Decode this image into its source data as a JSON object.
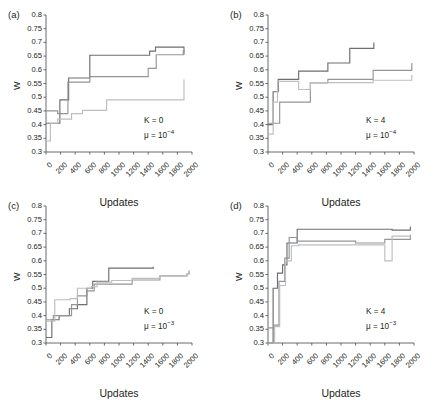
{
  "figure": {
    "xlabel": "Updates",
    "ylabel": "W",
    "panel_labels": [
      "(a)",
      "(b)",
      "(c)",
      "(d)"
    ],
    "y_ticks": [
      "0.3",
      "0.35",
      "0.4",
      "0.45",
      "0.5",
      "0.55",
      "0.6",
      "0.65",
      "0.7",
      "0.75",
      "0.8"
    ],
    "x_ticks": [
      "0",
      "200",
      "400",
      "600",
      "800",
      "1000",
      "1200",
      "1400",
      "1600",
      "1800",
      "2000"
    ],
    "colors": {
      "axis": "#58595b",
      "text": "#231f20",
      "line_dark": "#6d6e71",
      "line_mid": "#939598",
      "line_light": "#bcbec0"
    }
  },
  "chart_data": [
    {
      "type": "line",
      "title": "(a)",
      "xlabel": "Updates",
      "ylabel": "W",
      "xlim": [
        0,
        2000
      ],
      "ylim": [
        0.3,
        0.8
      ],
      "grid": false,
      "legend": "none",
      "annotations": [
        "K = 0",
        "μ = 10⁻⁴"
      ],
      "annotation_K": "K = 0",
      "annotation_mu_base": "μ = 10",
      "annotation_mu_exp": "−4",
      "step": "post",
      "series": [
        {
          "name": "run-1-dark",
          "color": "#6d6e71",
          "x": [
            0,
            40,
            150,
            190,
            280,
            310,
            580,
            600,
            1400,
            1420,
            1500,
            1880,
            1890
          ],
          "y": [
            0.405,
            0.405,
            0.405,
            0.49,
            0.49,
            0.57,
            0.57,
            0.653,
            0.653,
            0.668,
            0.683,
            0.683,
            0.655
          ]
        },
        {
          "name": "run-2-mid",
          "color": "#939598",
          "x": [
            0,
            40,
            130,
            160,
            280,
            300,
            580,
            600,
            1380,
            1400,
            1490,
            1510,
            1880,
            1900
          ],
          "y": [
            0.45,
            0.45,
            0.45,
            0.44,
            0.44,
            0.555,
            0.555,
            0.575,
            0.575,
            0.605,
            0.605,
            0.655,
            0.668,
            0.668
          ]
        },
        {
          "name": "run-3-light",
          "color": "#bcbec0",
          "x": [
            0,
            30,
            60,
            140,
            160,
            330,
            350,
            480,
            500,
            800,
            830,
            1870,
            1890
          ],
          "y": [
            0.34,
            0.34,
            0.405,
            0.405,
            0.42,
            0.42,
            0.44,
            0.44,
            0.452,
            0.452,
            0.49,
            0.49,
            0.565
          ]
        }
      ]
    },
    {
      "type": "line",
      "title": "(b)",
      "xlabel": "Updates",
      "ylabel": "W",
      "xlim": [
        0,
        2000
      ],
      "ylim": [
        0.3,
        0.8
      ],
      "grid": false,
      "legend": "none",
      "annotations": [
        "K = 4",
        "μ = 10⁻⁴"
      ],
      "annotation_K": "K = 4",
      "annotation_mu_base": "μ = 10",
      "annotation_mu_exp": "−4",
      "step": "post",
      "series": [
        {
          "name": "run-1-dark",
          "color": "#6d6e71",
          "x": [
            0,
            50,
            70,
            110,
            140,
            400,
            420,
            800,
            820,
            1100,
            1120,
            1430,
            1450
          ],
          "y": [
            0.4,
            0.4,
            0.52,
            0.52,
            0.565,
            0.565,
            0.595,
            0.595,
            0.625,
            0.625,
            0.678,
            0.678,
            0.7
          ]
        },
        {
          "name": "run-2-mid",
          "color": "#939598",
          "x": [
            0,
            60,
            90,
            130,
            160,
            560,
            580,
            800,
            820,
            1420,
            1440,
            1950,
            1970
          ],
          "y": [
            0.405,
            0.405,
            0.405,
            0.405,
            0.482,
            0.482,
            0.552,
            0.552,
            0.565,
            0.565,
            0.598,
            0.598,
            0.625
          ]
        },
        {
          "name": "run-3-light",
          "color": "#bcbec0",
          "x": [
            0,
            40,
            70,
            100,
            130,
            400,
            420,
            560,
            580,
            1420,
            1440,
            1950,
            1970
          ],
          "y": [
            0.365,
            0.365,
            0.482,
            0.482,
            0.558,
            0.558,
            0.528,
            0.528,
            0.553,
            0.553,
            0.562,
            0.562,
            0.582
          ]
        }
      ]
    },
    {
      "type": "line",
      "title": "(c)",
      "xlabel": "Updates",
      "ylabel": "W",
      "xlim": [
        0,
        2000
      ],
      "ylim": [
        0.3,
        0.8
      ],
      "grid": false,
      "legend": "none",
      "annotations": [
        "K = 0",
        "μ = 10⁻³"
      ],
      "annotation_K": "K = 0",
      "annotation_mu_base": "μ = 10",
      "annotation_mu_exp": "−3",
      "step": "post",
      "series": [
        {
          "name": "run-1-dark",
          "color": "#6d6e71",
          "x": [
            0,
            40,
            80,
            110,
            180,
            210,
            320,
            350,
            430,
            460,
            560,
            600,
            640,
            680,
            860,
            880,
            1450,
            1470
          ],
          "y": [
            0.32,
            0.32,
            0.385,
            0.385,
            0.4,
            0.4,
            0.425,
            0.425,
            0.44,
            0.44,
            0.5,
            0.5,
            0.525,
            0.525,
            0.573,
            0.573,
            0.573,
            0.578
          ]
        },
        {
          "name": "run-2-mid",
          "color": "#939598",
          "x": [
            0,
            40,
            100,
            130,
            350,
            380,
            430,
            460,
            560,
            600,
            660,
            700,
            1180,
            1220,
            1560,
            1600,
            1930,
            1960
          ],
          "y": [
            0.385,
            0.385,
            0.4,
            0.4,
            0.44,
            0.44,
            0.472,
            0.472,
            0.49,
            0.49,
            0.515,
            0.515,
            0.53,
            0.53,
            0.545,
            0.545,
            0.552,
            0.565
          ]
        },
        {
          "name": "run-3-light",
          "color": "#bcbec0",
          "x": [
            0,
            40,
            120,
            160,
            330,
            360,
            430,
            460,
            620,
            660,
            700,
            740,
            900,
            940,
            1180,
            1220,
            1560,
            1600,
            1930,
            1960
          ],
          "y": [
            0.38,
            0.38,
            0.458,
            0.458,
            0.462,
            0.462,
            0.5,
            0.5,
            0.506,
            0.506,
            0.522,
            0.522,
            0.528,
            0.528,
            0.536,
            0.536,
            0.545,
            0.545,
            0.552,
            0.562
          ]
        }
      ]
    },
    {
      "type": "line",
      "title": "(d)",
      "xlabel": "Updates",
      "ylabel": "W",
      "xlim": [
        0,
        2000
      ],
      "ylim": [
        0.3,
        0.8
      ],
      "grid": false,
      "legend": "none",
      "annotations": [
        "K = 4",
        "μ = 10⁻³"
      ],
      "annotation_K": "K = 4",
      "annotation_mu_base": "μ = 10",
      "annotation_mu_exp": "−3",
      "step": "post",
      "series": [
        {
          "name": "run-1-dark",
          "color": "#6d6e71",
          "x": [
            0,
            40,
            70,
            100,
            130,
            160,
            200,
            230,
            260,
            300,
            380,
            400,
            1560,
            1600,
            1650,
            1700,
            1930,
            1950
          ],
          "y": [
            0.3,
            0.3,
            0.5,
            0.5,
            0.555,
            0.555,
            0.585,
            0.585,
            0.665,
            0.665,
            0.665,
            0.715,
            0.715,
            0.715,
            0.715,
            0.712,
            0.712,
            0.725
          ]
        },
        {
          "name": "run-2-mid",
          "color": "#939598",
          "x": [
            0,
            40,
            80,
            110,
            150,
            180,
            230,
            260,
            290,
            330,
            400,
            430,
            1160,
            1200,
            1560,
            1600,
            1930,
            1950
          ],
          "y": [
            0.355,
            0.355,
            0.365,
            0.365,
            0.525,
            0.525,
            0.61,
            0.61,
            0.685,
            0.685,
            0.672,
            0.672,
            0.672,
            0.665,
            0.665,
            0.678,
            0.678,
            0.695
          ]
        },
        {
          "name": "run-3-light",
          "color": "#bcbec0",
          "x": [
            0,
            40,
            90,
            120,
            160,
            190,
            240,
            280,
            320,
            360,
            420,
            460,
            1560,
            1600,
            1660,
            1700,
            1930,
            1950
          ],
          "y": [
            0.3,
            0.3,
            0.36,
            0.36,
            0.51,
            0.51,
            0.6,
            0.6,
            0.655,
            0.655,
            0.658,
            0.658,
            0.658,
            0.6,
            0.6,
            0.69,
            0.69,
            0.69
          ]
        }
      ]
    }
  ]
}
